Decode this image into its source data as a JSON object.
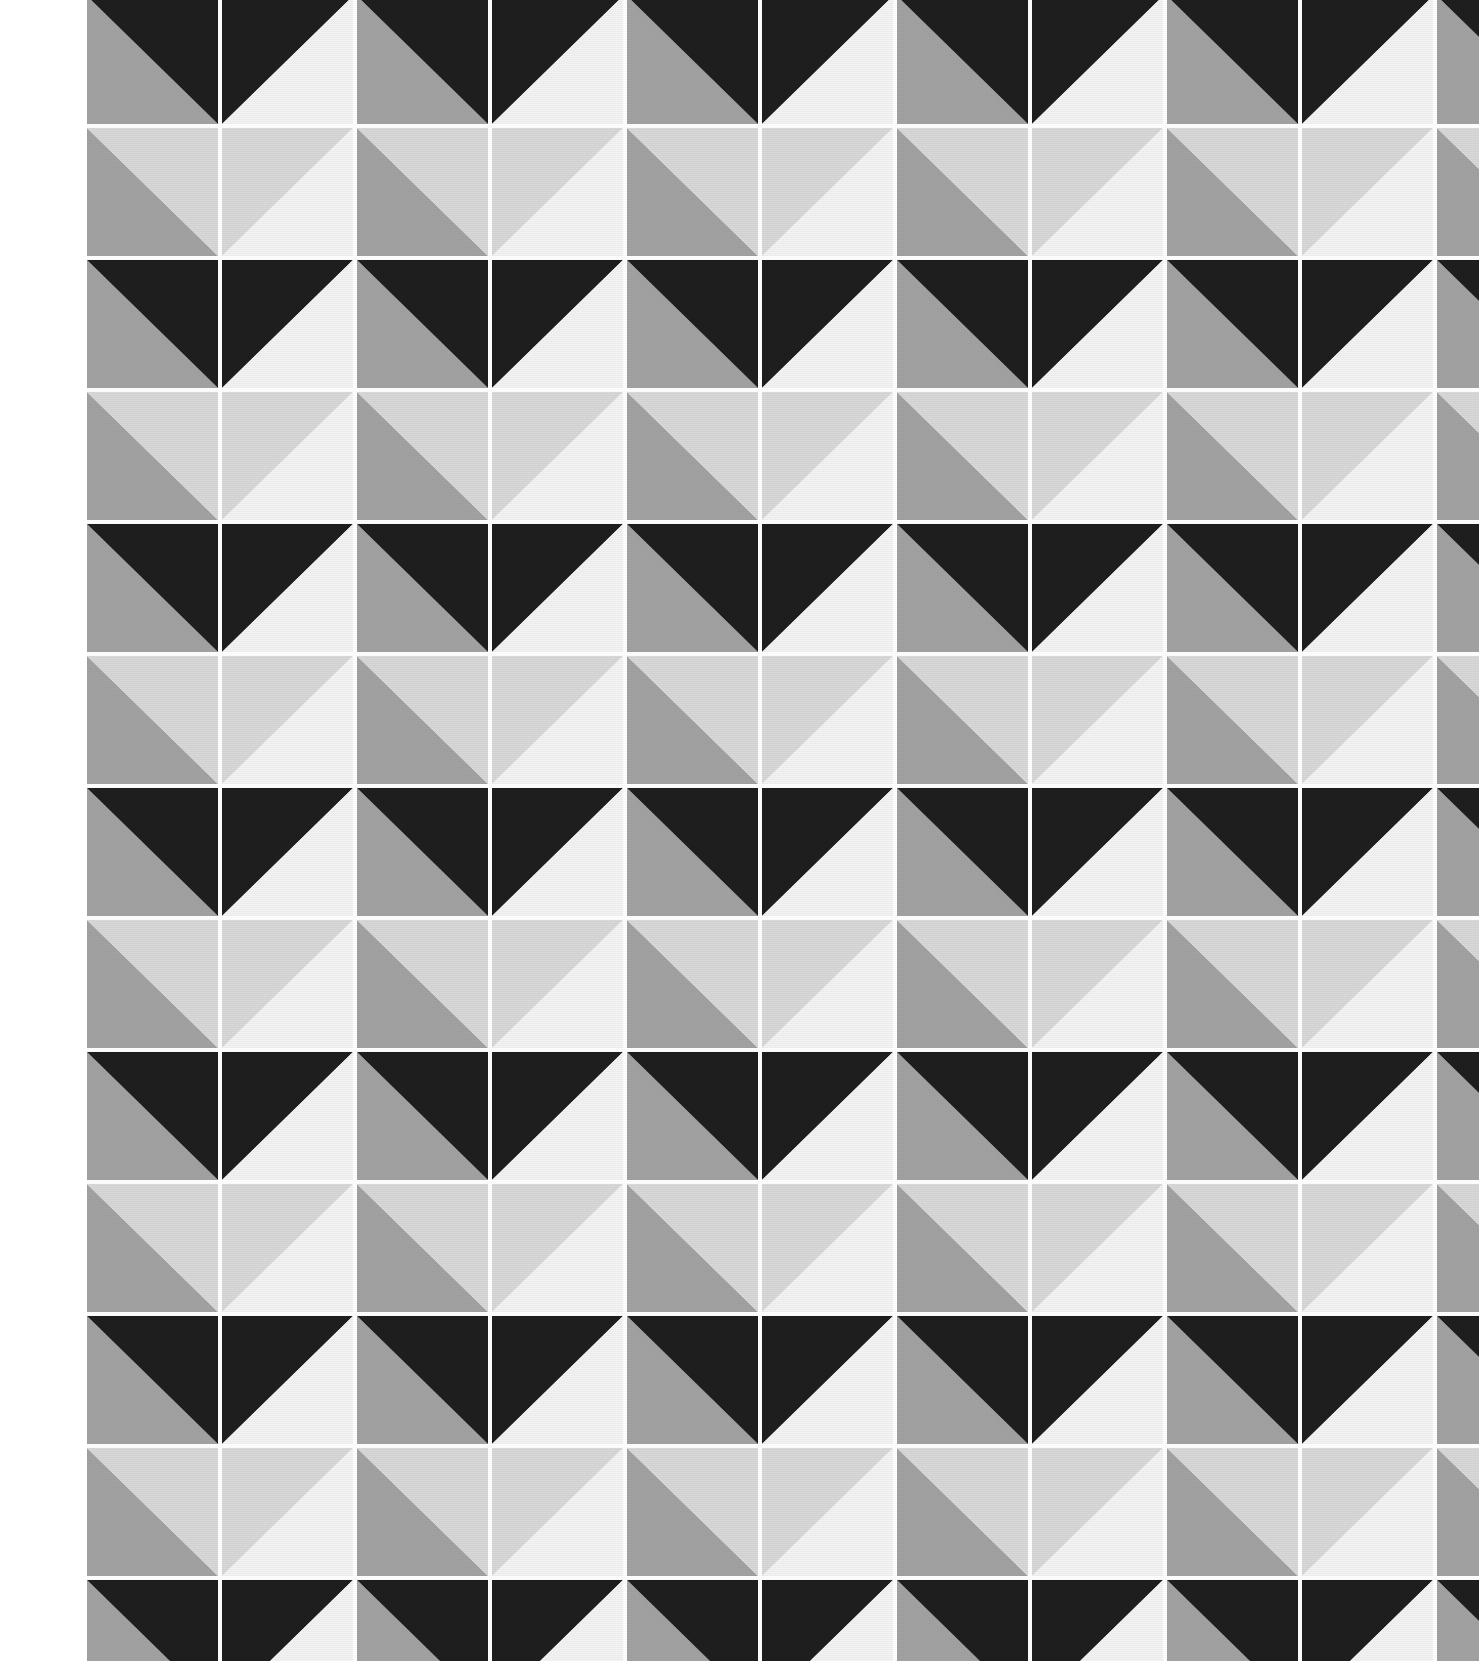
{
  "image": {
    "title": "Geometric half-square triangle fabric pattern",
    "subject": "printed textile swatch",
    "width": 1479,
    "height": 1661,
    "background_color": "#FFFFFF",
    "left_margin_label": "white fabric selvedge margin",
    "left_margin_width": 87,
    "texture": "fine woven fabric weave"
  },
  "palette": {
    "names": [
      "near-black",
      "mid-gray",
      "light-gray",
      "near-white",
      "grout-white"
    ],
    "near_black": "#1E1E1E",
    "mid_gray": "#A2A2A2",
    "light_gray": "#D8D8D8",
    "near_white": "#F3F3F3",
    "grout_white": "#FFFFFF"
  },
  "grid": {
    "origin_x": 87,
    "origin_y": -4,
    "cell_width": 135,
    "cell_height": 132,
    "gap": 4,
    "columns": 11,
    "rows": 13,
    "motif": "half-square triangle",
    "supertile": "2 x 2 cells",
    "gutter_color": "#FFFFFF",
    "gutter_width": 4
  },
  "chart_data": {
    "type": "heatmap",
    "xlabel": "column",
    "ylabel": "row",
    "legend": [
      "near-black",
      "mid-gray",
      "light-gray",
      "near-white"
    ],
    "note": "Each cell is a square split by one diagonal into two triangles. 'dir' = diagonal orientation; 'nw'/'sw' indicate which corner the split runs from. 'a' is the upper/left triangle color, 'b' is the lower/right triangle color.",
    "cells": [
      {
        "row": 0,
        "pattern": "dark-row",
        "cells": [
          {
            "dir": "nw",
            "a": "mid_gray",
            "b": "near_black"
          },
          {
            "dir": "ne",
            "a": "near_black",
            "b": "near_white"
          },
          {
            "dir": "nw",
            "a": "mid_gray",
            "b": "near_black"
          },
          {
            "dir": "ne",
            "a": "near_black",
            "b": "near_white"
          },
          {
            "dir": "nw",
            "a": "mid_gray",
            "b": "near_black"
          },
          {
            "dir": "ne",
            "a": "near_black",
            "b": "near_white"
          },
          {
            "dir": "nw",
            "a": "mid_gray",
            "b": "near_black"
          },
          {
            "dir": "ne",
            "a": "near_black",
            "b": "near_white"
          },
          {
            "dir": "nw",
            "a": "mid_gray",
            "b": "near_black"
          },
          {
            "dir": "ne",
            "a": "near_black",
            "b": "near_white"
          },
          {
            "dir": "nw",
            "a": "mid_gray",
            "b": "near_black"
          }
        ]
      },
      {
        "row": 1,
        "pattern": "light-row",
        "cells": [
          {
            "dir": "nw",
            "a": "mid_gray",
            "b": "light_gray"
          },
          {
            "dir": "ne",
            "a": "light_gray",
            "b": "near_white"
          },
          {
            "dir": "nw",
            "a": "mid_gray",
            "b": "light_gray"
          },
          {
            "dir": "ne",
            "a": "light_gray",
            "b": "near_white"
          },
          {
            "dir": "nw",
            "a": "mid_gray",
            "b": "light_gray"
          },
          {
            "dir": "ne",
            "a": "light_gray",
            "b": "near_white"
          },
          {
            "dir": "nw",
            "a": "mid_gray",
            "b": "light_gray"
          },
          {
            "dir": "ne",
            "a": "light_gray",
            "b": "near_white"
          },
          {
            "dir": "nw",
            "a": "mid_gray",
            "b": "light_gray"
          },
          {
            "dir": "ne",
            "a": "light_gray",
            "b": "near_white"
          },
          {
            "dir": "nw",
            "a": "mid_gray",
            "b": "light_gray"
          }
        ]
      }
    ],
    "row_sequence": [
      "dark-row",
      "light-row",
      "dark-row",
      "light-row",
      "dark-row",
      "light-row",
      "dark-row",
      "light-row",
      "dark-row",
      "light-row",
      "dark-row",
      "light-row",
      "dark-row"
    ],
    "row_count": 13,
    "column_count": 11
  }
}
